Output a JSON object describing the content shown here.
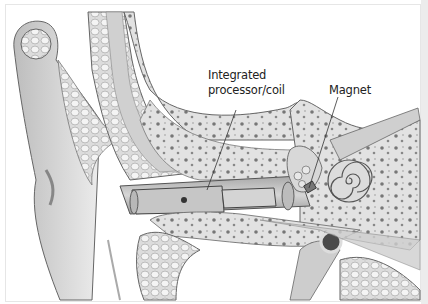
{
  "figure": {
    "labels": [
      {
        "id": "processor-coil",
        "line1": "Integrated",
        "line2": "processor/coil"
      },
      {
        "id": "magnet",
        "line1": "Magnet"
      }
    ],
    "colors": {
      "background": "#ffffff",
      "line": "#444444",
      "bone": "#d8d8d8",
      "tissue": "#c4c4c4",
      "canal": "#bdbdbd",
      "dark": "#555555",
      "border_strip": "#ececec"
    }
  }
}
